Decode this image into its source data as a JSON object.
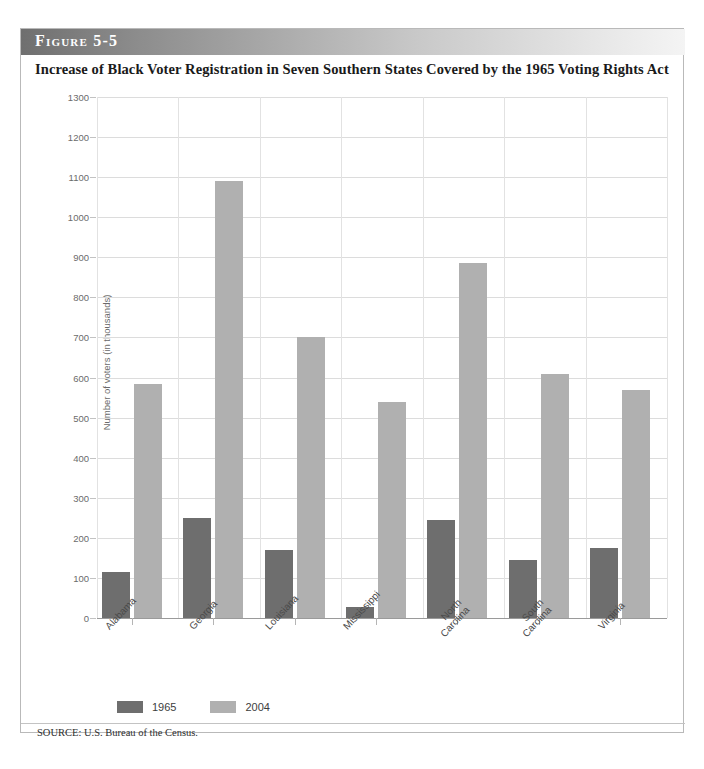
{
  "figure": {
    "label": "Figure 5-5",
    "title": "Increase of Black Voter Registration in Seven Southern States Covered by the 1965 Voting Rights Act",
    "source": "SOURCE: U.S. Bureau of the Census."
  },
  "legend": {
    "items": [
      {
        "label": "1965",
        "color": "#6e6e6e"
      },
      {
        "label": "2004",
        "color": "#b0b0b0"
      }
    ]
  },
  "chart_data": {
    "type": "bar",
    "title": "Increase of Black Voter Registration in Seven Southern States Covered by the 1965 Voting Rights Act",
    "xlabel": "",
    "ylabel": "Number of voters (in thousands)",
    "ylim": [
      0,
      1300
    ],
    "ytick_step": 100,
    "yticks": [
      0,
      100,
      200,
      300,
      400,
      500,
      600,
      700,
      800,
      900,
      1000,
      1100,
      1200,
      1300
    ],
    "ytick_labels": [
      "0",
      "100",
      "200",
      "300",
      "400",
      "500",
      "600",
      "700",
      "800",
      "900",
      "1000",
      "1100",
      "1200",
      "1300"
    ],
    "grid": true,
    "legend_position": "below-axis-left",
    "categories": [
      "Alabama",
      "Georgia",
      "Louisiana",
      "Mississippi",
      "North\nCarolina",
      "South\nCarolina",
      "Virginia"
    ],
    "series": [
      {
        "name": "1965",
        "color": "#6e6e6e",
        "values": [
          115,
          250,
          170,
          28,
          245,
          145,
          175
        ]
      },
      {
        "name": "2004",
        "color": "#b0b0b0",
        "values": [
          585,
          1090,
          700,
          540,
          885,
          610,
          570
        ]
      }
    ]
  }
}
